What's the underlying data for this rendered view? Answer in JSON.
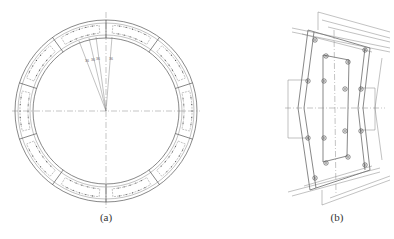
{
  "figure": {
    "panels": [
      {
        "id": "a",
        "caption": "(a)",
        "description": "Segmented circular tunnel lining ring with reinforcement cages",
        "ring": {
          "cx": 106,
          "cy": 111,
          "outer_r": 91,
          "inner_r": 73,
          "segments": 10
        },
        "angle_labels": [
          "36",
          "36",
          "36",
          "36"
        ]
      },
      {
        "id": "b",
        "caption": "(b)",
        "description": "Single segment detail with bolt holes and dimension lines",
        "dimension_labels": [
          "",
          "",
          "",
          "",
          "",
          ""
        ]
      }
    ]
  },
  "colors": {
    "line": "#555555",
    "background": "#ffffff"
  }
}
